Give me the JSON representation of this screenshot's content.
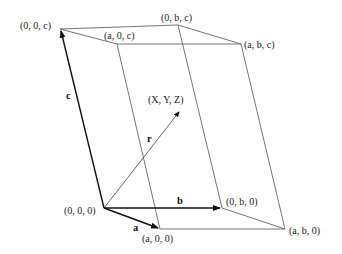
{
  "diagram": {
    "type": "unit-cell-parallelepiped",
    "vertices": {
      "origin": {
        "label": "(0, 0, 0)",
        "x": 104,
        "y": 208
      },
      "a00": {
        "label": "(a, 0, 0)",
        "x": 160,
        "y": 229
      },
      "0b0": {
        "label": "(0, b, 0)",
        "x": 222,
        "y": 208
      },
      "ab0": {
        "label": "(a, b, 0)",
        "x": 285,
        "y": 229
      },
      "00c": {
        "label": "(0, 0, c)",
        "x": 60,
        "y": 29
      },
      "a0c": {
        "label": "(a, 0, c)",
        "x": 117,
        "y": 44
      },
      "0bc": {
        "label": "(0, b, c)",
        "x": 178,
        "y": 25
      },
      "abc": {
        "label": "(a, b, c)",
        "x": 241,
        "y": 44
      }
    },
    "vectors": {
      "a": {
        "label": "a"
      },
      "b": {
        "label": "b"
      },
      "c": {
        "label": "c"
      },
      "r": {
        "label": "r",
        "end_label": "(X, Y, Z)"
      }
    },
    "colors": {
      "line": "#555555",
      "vector": "#111111",
      "text": "#222222",
      "background": "#ffffff"
    }
  }
}
